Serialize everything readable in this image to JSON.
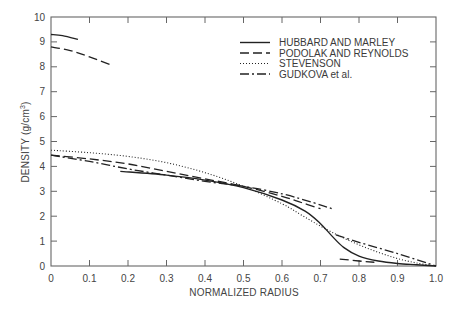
{
  "chart_data": {
    "type": "line",
    "title": "",
    "xlabel": "NORMALIZED RADIUS",
    "ylabel": "DENSITY (g/cm3)",
    "ylabel_parts": {
      "main": "DENSITY (g/cm",
      "sup": "3",
      "close": ")"
    },
    "xlim": [
      0,
      1.0
    ],
    "ylim": [
      0,
      10
    ],
    "xticks": [
      "0",
      "0.1",
      "0.2",
      "0.3",
      "0.4",
      "0.5",
      "0.6",
      "0.7",
      "0.8",
      "0.9",
      "1.0"
    ],
    "yticks": [
      "0",
      "1",
      "2",
      "3",
      "4",
      "5",
      "6",
      "7",
      "8",
      "9",
      "10"
    ],
    "grid": false,
    "legend_position": "upper right",
    "series": [
      {
        "name": "HUBBARD AND MARLEY",
        "style": "solid",
        "segments": [
          {
            "x": [
              0,
              0.03,
              0.07
            ],
            "y": [
              9.3,
              9.25,
              9.1
            ]
          },
          {
            "x": [
              0.18,
              0.3,
              0.4,
              0.5,
              0.6,
              0.66,
              0.7,
              0.73,
              0.76,
              0.8,
              0.85,
              0.9,
              0.95,
              1.0
            ],
            "y": [
              3.8,
              3.65,
              3.45,
              3.15,
              2.65,
              2.2,
              1.7,
              1.2,
              0.75,
              0.4,
              0.2,
              0.1,
              0.05,
              0.0
            ]
          }
        ]
      },
      {
        "name": "PODOLAK AND REYNOLDS",
        "style": "dashed",
        "segments": [
          {
            "x": [
              0,
              0.05,
              0.1,
              0.16
            ],
            "y": [
              8.8,
              8.65,
              8.4,
              8.05
            ]
          },
          {
            "x": [
              0,
              0.1,
              0.2,
              0.3,
              0.4,
              0.5,
              0.6,
              0.65,
              0.7
            ],
            "y": [
              4.45,
              4.3,
              4.1,
              3.8,
              3.5,
              3.2,
              2.8,
              2.55,
              2.3
            ]
          },
          {
            "x": [
              0.75,
              0.8,
              0.84
            ],
            "y": [
              0.28,
              0.2,
              0.15
            ]
          }
        ]
      },
      {
        "name": "STEVENSON",
        "style": "dotted",
        "segments": [
          {
            "x": [
              0,
              0.1,
              0.2,
              0.3,
              0.4,
              0.5,
              0.6,
              0.65,
              0.7,
              0.75,
              0.8,
              0.85,
              0.9,
              0.95,
              1.0
            ],
            "y": [
              4.65,
              4.55,
              4.4,
              4.15,
              3.75,
              3.2,
              2.5,
              2.05,
              1.6,
              1.2,
              0.85,
              0.55,
              0.3,
              0.12,
              0.0
            ]
          }
        ]
      },
      {
        "name": "GUDKOVA et al.",
        "style": "dashdot",
        "segments": [
          {
            "x": [
              0,
              0.1,
              0.2,
              0.3,
              0.4,
              0.5,
              0.6,
              0.68,
              0.73
            ],
            "y": [
              4.45,
              4.2,
              3.9,
              3.65,
              3.4,
              3.2,
              2.9,
              2.55,
              2.3
            ]
          },
          {
            "x": [
              0.74,
              0.8,
              0.9,
              1.0
            ],
            "y": [
              1.25,
              0.95,
              0.5,
              0.0
            ]
          }
        ]
      }
    ]
  }
}
